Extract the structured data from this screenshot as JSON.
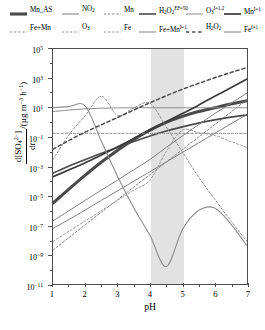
{
  "chart_data": {
    "type": "line",
    "title": "",
    "xlabel": "pH",
    "ylabel": "d[SO4 2-]/dt /(ug m-3 h-1)",
    "xlim": [
      1,
      7
    ],
    "ylim": [
      1e-11,
      100000.0
    ],
    "yscale": "log",
    "grid": false,
    "legend_position": "top",
    "shaded_band": {
      "x_start": 4.0,
      "x_end": 5.0,
      "color": "#e2e2e2"
    },
    "xticks": [
      "1",
      "2",
      "3",
      "4",
      "5",
      "6",
      "7"
    ],
    "yticks": [
      "10^5",
      "10^3",
      "10^1",
      "10^-1",
      "10^-3",
      "10^-5",
      "10^-7",
      "10^-9",
      "10^-11"
    ],
    "series": [
      {
        "name": "Mn_AS",
        "style": "solid",
        "color": "#4a4a4a",
        "width": 3.1,
        "x": [
          1,
          1.5,
          2,
          2.5,
          3,
          3.5,
          4,
          4.5,
          5,
          5.5,
          6,
          6.5,
          7
        ],
        "y": [
          3.2e-06,
          3e-05,
          0.00026,
          0.002,
          0.013,
          0.07,
          0.3,
          1.0,
          2.6,
          5.5,
          10.0,
          18.0,
          30.0
        ]
      },
      {
        "name": "NO2",
        "style": "solid",
        "color": "#7f7f7f",
        "width": 1.0,
        "x": [
          1,
          1.5,
          2,
          2.5,
          3,
          3.5,
          4,
          4.5,
          5,
          5.5,
          6,
          6.5,
          7
        ],
        "y": [
          6e-08,
          2.5e-07,
          1.1e-06,
          5e-06,
          2.2e-05,
          0.0001,
          0.00045,
          0.002,
          0.009,
          0.04,
          0.18,
          0.8,
          3.5
        ]
      },
      {
        "name": "Mn",
        "style": "dashed",
        "color": "#7f7f7f",
        "width": 1.0,
        "x": [
          1,
          1.5,
          2,
          2.5,
          3,
          3.5,
          4,
          4.5,
          5,
          5.5,
          6,
          6.5,
          7
        ],
        "y": [
          2e-09,
          1.5e-08,
          1.1e-07,
          8e-07,
          5.5e-06,
          4e-05,
          0.00028,
          0.002,
          0.014,
          0.1,
          0.7,
          5.0,
          35.0
        ]
      },
      {
        "name": "H2O2 EF=50",
        "style": "solid",
        "color": "#4a4a4a",
        "width": 1.6,
        "x": [
          1,
          1.5,
          2,
          2.5,
          3,
          3.5,
          4,
          4.5,
          5,
          5.5,
          6,
          6.5,
          7
        ],
        "y": [
          0.00035,
          0.0011,
          0.003,
          0.008,
          0.02,
          0.05,
          0.12,
          0.26,
          0.5,
          0.9,
          1.5,
          2.3,
          3.2
        ]
      },
      {
        "name": "O3 I=1.2",
        "style": "solid",
        "color": "#8c8c8c",
        "width": 1.0,
        "x": [
          1,
          1.5,
          2,
          2.5,
          3,
          3.5,
          4,
          4.5,
          5,
          5.5,
          6,
          6.5,
          7
        ],
        "y": [
          5.5,
          7.0,
          8.5,
          9.3,
          9.8,
          10.0,
          10.0,
          10.0,
          10.0,
          10.0,
          10.0,
          10.0,
          10.0
        ]
      },
      {
        "name": "Mn I=1",
        "style": "solid",
        "color": "#3a3a3a",
        "width": 1.7,
        "x": [
          1,
          1.5,
          2,
          2.5,
          3,
          3.5,
          4,
          4.5,
          5,
          5.5,
          6,
          6.5,
          7
        ],
        "y": [
          0.0002,
          0.0006,
          0.0018,
          0.006,
          0.022,
          0.08,
          0.3,
          1.1,
          4.0,
          15.0,
          60.0,
          230.0,
          900.0
        ]
      },
      {
        "name": "Fe+Mn",
        "style": "dashed",
        "color": "#8c8c8c",
        "width": 1.0,
        "x": [
          1,
          1.5,
          2,
          2.5,
          3,
          3.5,
          4,
          4.5,
          5,
          5.5,
          6,
          6.5,
          7
        ],
        "y": [
          0.003,
          0.15,
          3.0,
          60.0,
          3.0,
          10.0,
          20.0,
          0.5,
          0.01,
          0.0002,
          6e-06,
          2e-07,
          8e-09
        ]
      },
      {
        "name": "O3",
        "style": "dashed",
        "color": "#8c8c8c",
        "width": 1.0,
        "x": [
          1,
          1.5,
          2,
          2.5,
          3,
          3.5,
          4,
          4.5,
          5,
          5.5,
          6,
          6.5,
          7
        ],
        "y": [
          0.18,
          0.18,
          0.18,
          0.18,
          0.18,
          0.18,
          0.18,
          0.18,
          0.18,
          0.18,
          0.18,
          0.18,
          0.18
        ]
      },
      {
        "name": "Fe",
        "style": "dashed",
        "color": "#9a9a9a",
        "width": 1.0,
        "x": [
          1,
          1.5,
          2,
          2.5,
          3,
          3.5,
          4,
          4.5,
          5,
          5.5,
          6,
          6.5,
          7
        ],
        "y": [
          8e-09,
          4e-08,
          2e-07,
          1e-06,
          5e-06,
          2.5e-05,
          0.00012,
          0.01,
          0.3,
          0.2,
          0.13,
          0.05,
          0.02
        ]
      },
      {
        "name": "Fe+Mn I=1",
        "style": "solid",
        "color": "#8c8c8c",
        "width": 1.1,
        "x": [
          1,
          1.5,
          2,
          2.5,
          3,
          3.5,
          4,
          4.5,
          5,
          5.5,
          6,
          6.5,
          7
        ],
        "y": [
          10.0,
          12.0,
          13.0,
          0.05,
          0.0002,
          1.5e-06,
          2e-08,
          1.5e-10,
          5e-08,
          1e-06,
          1.5e-06,
          1.2e-07,
          4e-09
        ]
      },
      {
        "name": "H2O2",
        "style": "dashed",
        "color": "#4a4a4a",
        "width": 1.5,
        "x": [
          1,
          1.5,
          2,
          2.5,
          3,
          3.5,
          4,
          4.5,
          5,
          5.5,
          6,
          6.5,
          7
        ],
        "y": [
          0.015,
          0.06,
          0.22,
          0.7,
          2.2,
          7.0,
          22.0,
          65.0,
          180.0,
          450.0,
          1100.0,
          2500.0,
          5500.0
        ]
      },
      {
        "name": "Fe I=1",
        "style": "solid",
        "color": "#7f7f7f",
        "width": 1.0,
        "x": [
          1,
          1.5,
          2,
          2.5,
          3,
          3.5,
          4,
          4.5,
          5,
          5.5,
          6,
          6.5,
          7
        ],
        "y": [
          2e-07,
          1e-06,
          5e-06,
          2.5e-05,
          0.00012,
          0.0006,
          0.003,
          0.02,
          0.12,
          0.7,
          4.0,
          20.0,
          100.0
        ]
      }
    ]
  },
  "legend": {
    "row1": [
      {
        "label": "Mn_AS",
        "html": "Mn_AS",
        "style": "solid",
        "color": "#4a4a4a",
        "width": 3.1,
        "left": 10
      },
      {
        "label": "NO2",
        "html": "NO<sub>2</sub>",
        "style": "solid",
        "color": "#7f7f7f",
        "width": 1.0,
        "left": 62
      },
      {
        "label": "Mn",
        "html": "Mn",
        "style": "dashed",
        "color": "#7f7f7f",
        "width": 1.0,
        "left": 104
      },
      {
        "label": "H2O2 EF=50",
        "html": "H<sub>2</sub>O<sub>2</sub><sup>EF=50</sup>",
        "style": "solid",
        "color": "#4a4a4a",
        "width": 1.6,
        "left": 139
      },
      {
        "label": "O3 I=1.2",
        "html": "O<sub>3</sub><sup>I=1.2</sup>",
        "style": "solid",
        "color": "#8c8c8c",
        "width": 1.0,
        "left": 186
      },
      {
        "label": "Mn I=1",
        "html": "Mn<sup>I=1</sup>",
        "style": "solid",
        "color": "#3a3a3a",
        "width": 1.7,
        "left": 224
      }
    ],
    "row2": [
      {
        "label": "Fe+Mn",
        "html": "Fe+Mn",
        "style": "dashed",
        "color": "#8c8c8c",
        "width": 1.0,
        "left": 10
      },
      {
        "label": "O3",
        "html": "O<sub>3</sub>",
        "style": "dashed",
        "color": "#8c8c8c",
        "width": 1.0,
        "left": 62
      },
      {
        "label": "Fe",
        "html": "Fe",
        "style": "dashed",
        "color": "#9a9a9a",
        "width": 1.0,
        "left": 104
      },
      {
        "label": "Fe+Mn I=1",
        "html": "Fe+Mn<sup>I=1</sup>",
        "style": "solid",
        "color": "#8c8c8c",
        "width": 1.1,
        "left": 139
      },
      {
        "label": "H2O2",
        "html": "H<sub>2</sub>O<sub>2</sub>",
        "style": "dashed",
        "color": "#4a4a4a",
        "width": 1.5,
        "left": 186
      },
      {
        "label": "Fe I=1",
        "html": "Fe<sup>I=1</sup>",
        "style": "solid",
        "color": "#7f7f7f",
        "width": 1.0,
        "left": 224
      }
    ]
  },
  "axes": {
    "x_title": "pH",
    "y_title_numerator_html": "d[SO<sub>4</sub><sup>2&#8722;</sup>]",
    "y_title_denominator_html": "d<i>t</i>",
    "y_title_unit_html": "/(&#181;g m<sup>&#8722;3</sup> h<sup>&#8722;1</sup>)"
  }
}
